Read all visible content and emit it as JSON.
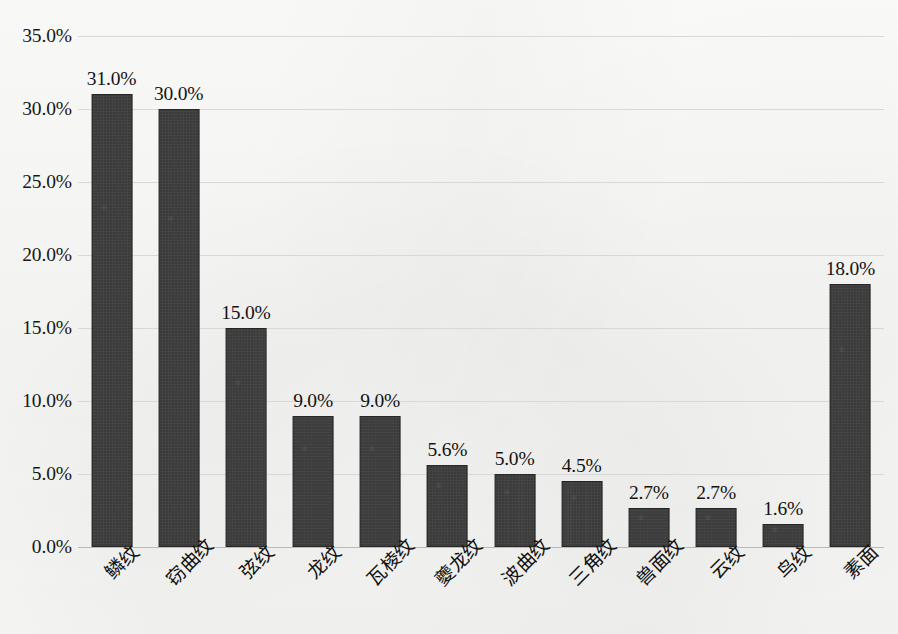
{
  "chart_data": {
    "type": "bar",
    "title": "",
    "subtitle": "",
    "xlabel": "",
    "ylabel": "",
    "ylim": [
      0,
      35
    ],
    "grid": true,
    "grid_axis": "y",
    "legend": false,
    "legend_position": "none",
    "bar_color": "#3b3b3b",
    "gridline_color": "#d8d8d6",
    "background_color": "#fbfbfa",
    "value_label_format": "percent_one_decimal",
    "categories": [
      "鳞纹",
      "窃曲纹",
      "弦纹",
      "龙纹",
      "瓦棱纹",
      "夔龙纹",
      "波曲纹",
      "三角纹",
      "兽面纹",
      "云纹",
      "鸟纹",
      "素面"
    ],
    "values": [
      31.0,
      30.0,
      15.0,
      9.0,
      9.0,
      5.6,
      5.0,
      4.5,
      2.7,
      2.7,
      1.6,
      18.0
    ],
    "value_labels": [
      "31.0%",
      "30.0%",
      "15.0%",
      "9.0%",
      "9.0%",
      "5.6%",
      "5.0%",
      "4.5%",
      "2.7%",
      "2.7%",
      "1.6%",
      "18.0%"
    ],
    "yticks": [
      0,
      5,
      10,
      15,
      20,
      25,
      30,
      35
    ],
    "ytick_labels": [
      "0.0%",
      "5.0%",
      "10.0%",
      "15.0%",
      "20.0%",
      "25.0%",
      "30.0%",
      "35.0%"
    ]
  }
}
